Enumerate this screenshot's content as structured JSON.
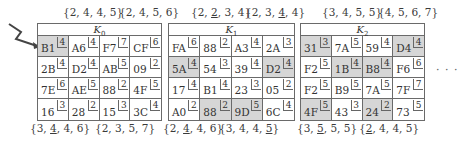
{
  "keys": [
    {
      "name": "K",
      "sub": "0",
      "top_labels": [
        "{2, 4, 4, 5}",
        "{2, 4, 5, 6}"
      ],
      "bottom_labels": [
        "{3, <u>4</u>, 4, 6}",
        "{2, 3, 5, 7}"
      ],
      "cells": [
        [
          {
            "v": "B1",
            "c": "4",
            "hl": true
          },
          {
            "v": "A6",
            "c": "4"
          },
          {
            "v": "F7",
            "c": "7"
          },
          {
            "v": "CF",
            "c": "6"
          }
        ],
        [
          {
            "v": "2B",
            "c": "4"
          },
          {
            "v": "D2",
            "c": "4"
          },
          {
            "v": "AB",
            "c": "5"
          },
          {
            "v": "09",
            "c": "2"
          }
        ],
        [
          {
            "v": "7E",
            "c": "6"
          },
          {
            "v": "AE",
            "c": "5"
          },
          {
            "v": "88",
            "c": "2"
          },
          {
            "v": "4F",
            "c": "5"
          }
        ],
        [
          {
            "v": "16",
            "c": "3"
          },
          {
            "v": "28",
            "c": "2"
          },
          {
            "v": "15",
            "c": "3"
          },
          {
            "v": "3C",
            "c": "4"
          }
        ]
      ]
    },
    {
      "name": "K",
      "sub": "1",
      "top_labels": [
        "{2, <u>2</u>, 3, 4}",
        "{2, 3, <u>4</u>, 4}"
      ],
      "bottom_labels": [
        "{2, <u>4</u>, 4, 6}",
        "{3, 4, 4, <u>5</u>}"
      ],
      "cells": [
        [
          {
            "v": "FA",
            "c": "6"
          },
          {
            "v": "88",
            "c": "2"
          },
          {
            "v": "A3",
            "c": "4"
          },
          {
            "v": "2A",
            "c": "3"
          }
        ],
        [
          {
            "v": "5A",
            "c": "4",
            "hl": true
          },
          {
            "v": "54",
            "c": "3"
          },
          {
            "v": "39",
            "c": "4"
          },
          {
            "v": "D2",
            "c": "4",
            "hl": true
          }
        ],
        [
          {
            "v": "17",
            "c": "4"
          },
          {
            "v": "B1",
            "c": "4"
          },
          {
            "v": "23",
            "c": "3"
          },
          {
            "v": "05",
            "c": "2"
          }
        ],
        [
          {
            "v": "A0",
            "c": "2"
          },
          {
            "v": "88",
            "c": "2",
            "hl": true
          },
          {
            "v": "9D",
            "c": "5",
            "hl": true
          },
          {
            "v": "6C",
            "c": "4"
          }
        ]
      ]
    },
    {
      "name": "K",
      "sub": "2",
      "top_labels": [
        "{3, 4, 5, 5}",
        "{4, 5, 6, 7}"
      ],
      "bottom_labels": [
        "{3, <u>5</u>, 5, 5}",
        "{<u>2</u>, 4, 4, 5}"
      ],
      "cells": [
        [
          {
            "v": "31",
            "c": "3",
            "hl": true
          },
          {
            "v": "7A",
            "c": "5"
          },
          {
            "v": "59",
            "c": "4"
          },
          {
            "v": "D4",
            "c": "4",
            "hl": true
          }
        ],
        [
          {
            "v": "F2",
            "c": "5"
          },
          {
            "v": "1B",
            "c": "4",
            "hl": true
          },
          {
            "v": "B8",
            "c": "4",
            "hl": true
          },
          {
            "v": "F6",
            "c": "6"
          }
        ],
        [
          {
            "v": "F2",
            "c": "5"
          },
          {
            "v": "B9",
            "c": "5"
          },
          {
            "v": "7A",
            "c": "5"
          },
          {
            "v": "7F",
            "c": "7"
          }
        ],
        [
          {
            "v": "4F",
            "c": "5",
            "hl": true
          },
          {
            "v": "43",
            "c": "3"
          },
          {
            "v": "24",
            "c": "2",
            "hl": true
          },
          {
            "v": "73",
            "c": "5"
          }
        ]
      ]
    }
  ],
  "continuation": "· · ·",
  "icons": {
    "arrow": "zigzag-arrow-icon"
  }
}
